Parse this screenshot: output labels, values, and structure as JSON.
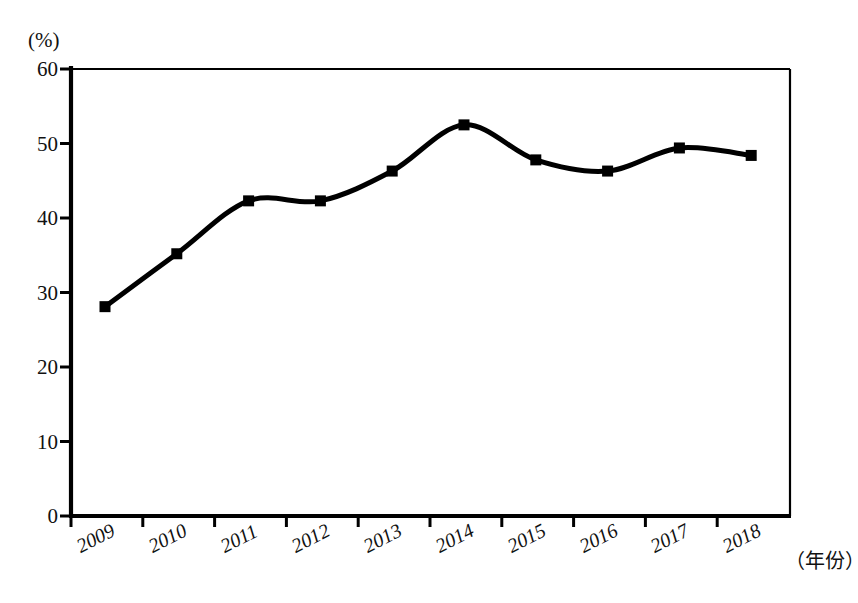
{
  "chart_data": {
    "type": "line",
    "title": "",
    "subtitle": "",
    "xlabel": "年份",
    "xlabel_display": "（年份）",
    "ylabel": "",
    "yunit": "(%)",
    "categories": [
      "2009",
      "2010",
      "2011",
      "2012",
      "2013",
      "2014",
      "2015",
      "2016",
      "2017",
      "2018"
    ],
    "values": [
      28.1,
      35.2,
      42.3,
      42.3,
      46.3,
      52.5,
      47.8,
      46.3,
      49.4,
      48.4
    ],
    "series": [
      {
        "name": "",
        "values": [
          28.1,
          35.2,
          42.3,
          42.3,
          46.3,
          52.5,
          47.8,
          46.3,
          49.4,
          48.4
        ],
        "color": "#000000",
        "marker": "square",
        "smooth": true
      }
    ],
    "ylim": [
      0,
      60
    ],
    "yticks": [
      0,
      10,
      20,
      30,
      40,
      50,
      60
    ],
    "ytick_labels": [
      "0",
      "10",
      "20",
      "30",
      "40",
      "50",
      "60"
    ],
    "xtick_labels": [
      "2009",
      "2010",
      "2011",
      "2012",
      "2013",
      "2014",
      "2015",
      "2016",
      "2017",
      "2018"
    ],
    "grid": false,
    "legend": false,
    "legend_position": "none",
    "frame": "box",
    "annotations": []
  },
  "colors": {
    "line": "#000000",
    "marker": "#000000",
    "axis": "#000000",
    "background": "#ffffff"
  }
}
